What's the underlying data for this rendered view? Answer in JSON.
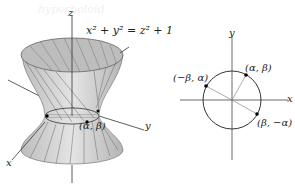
{
  "watermark": "hyperboloid",
  "left_figure": {
    "title": "hyperboloid of one sheet",
    "equation": "x² + y² = z² + 1",
    "axis_labels": {
      "x": "x",
      "y": "y",
      "z": "z"
    },
    "point_label": "(α, β)",
    "colors": {
      "surface": "#cfcfcf",
      "surface_dark": "#a9a9a9",
      "rulings": "#5a5a5a",
      "axis": "#333333"
    }
  },
  "right_figure": {
    "title": "unit circle",
    "axis_labels": {
      "x": "x",
      "y": "y"
    },
    "points": [
      {
        "label": "(α, β)"
      },
      {
        "label": "(−β, α)"
      },
      {
        "label": "(β, −α)"
      }
    ],
    "colors": {
      "circle": "#333333",
      "axis": "#555555",
      "radius": "#777777"
    }
  }
}
